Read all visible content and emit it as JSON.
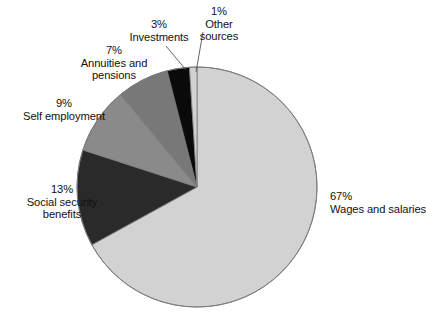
{
  "chart_data": {
    "type": "pie",
    "title": "",
    "subtitle": "",
    "xlabel": "",
    "ylabel": "",
    "legend_position": "none",
    "grid": false,
    "units": "percent",
    "start_angle_deg": 0,
    "direction": "clockwise",
    "categories": [
      "Wages and salaries",
      "Social security benefits",
      "Self employment",
      "Annuities and pensions",
      "Investments",
      "Other sources"
    ],
    "values": [
      67,
      13,
      9,
      7,
      3,
      1
    ],
    "slices": [
      {
        "label": "Wages and salaries",
        "value": 67,
        "percent_text": "67%",
        "color": "#d2d2d2",
        "label_lines": [
          "67%",
          "Wages and salaries"
        ],
        "leader_line": false
      },
      {
        "label": "Social security benefits",
        "value": 13,
        "percent_text": "13%",
        "color": "#2a2a2a",
        "label_lines": [
          "13%",
          "Social security",
          "benefits"
        ],
        "leader_line": false
      },
      {
        "label": "Self employment",
        "value": 9,
        "percent_text": "9%",
        "color": "#8a8a8a",
        "label_lines": [
          "9%",
          "Self employment"
        ],
        "leader_line": false
      },
      {
        "label": "Annuities and pensions",
        "value": 7,
        "percent_text": "7%",
        "color": "#787878",
        "label_lines": [
          "7%",
          "Annuities and",
          "pensions"
        ],
        "leader_line": false
      },
      {
        "label": "Investments",
        "value": 3,
        "percent_text": "3%",
        "color": "#0a0a0a",
        "label_lines": [
          "3%",
          "Investments"
        ],
        "leader_line": true
      },
      {
        "label": "Other sources",
        "value": 1,
        "percent_text": "1%",
        "color": "#d2d2d2",
        "label_lines": [
          "1%",
          "Other",
          "sources"
        ],
        "leader_line": true
      }
    ]
  },
  "labels": {
    "wages": {
      "pct": "67%",
      "name": "Wages and salaries"
    },
    "social": {
      "pct": "13%",
      "name": "Social security",
      "name2": "benefits"
    },
    "selfemp": {
      "pct": "9%",
      "name": "Self employment"
    },
    "annuities": {
      "pct": "7%",
      "name": "Annuities and",
      "name2": "pensions"
    },
    "investments": {
      "pct": "3%",
      "name": "Investments"
    },
    "other": {
      "pct": "1%",
      "name": "Other",
      "name2": "sources"
    }
  },
  "style": {
    "background": "#ffffff",
    "text_color": "#111111",
    "outline_color": "#7a7a7a",
    "leader_color": "#555555"
  }
}
